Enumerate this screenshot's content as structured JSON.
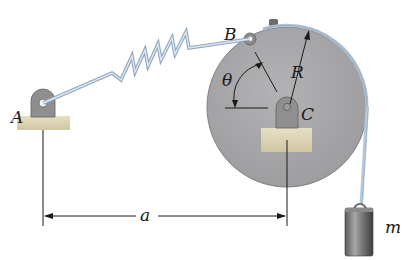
{
  "labels": {
    "point_a": "A",
    "point_b": "B",
    "point_c": "C",
    "angle": "θ",
    "radius": "R",
    "dimension": "a",
    "mass": "m"
  },
  "colors": {
    "disk": "#a7a7a9",
    "disk_edge": "#7e7e80",
    "bracket": "#8f8f91",
    "ground": "#d9d2b4",
    "spring": "#b8cde0",
    "cable": "#b4c8dc",
    "line": "#1a1a1a"
  }
}
